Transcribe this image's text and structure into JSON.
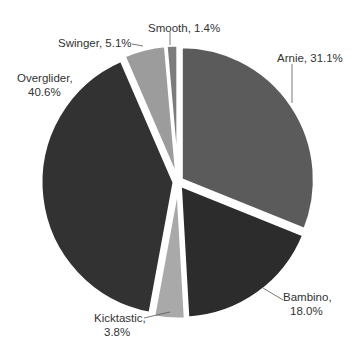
{
  "chart_data": {
    "type": "pie",
    "title": "",
    "start_angle_deg": 0,
    "direction": "clockwise",
    "exploded": true,
    "slices": [
      {
        "label": "Arnie",
        "value": 31.1,
        "display": "Arnie, 31.1%",
        "color": "#5b5b5b"
      },
      {
        "label": "Bambino",
        "value": 18.0,
        "display_line1": "Bambino,",
        "display_line2": "18.0%",
        "color": "#2c2c2c"
      },
      {
        "label": "Kicktastic",
        "value": 3.8,
        "display_line1": "Kicktastic,",
        "display_line2": "3.8%",
        "color": "#a9a9a9"
      },
      {
        "label": "Overglider",
        "value": 40.6,
        "display_line1": "Overglider,",
        "display_line2": "40.6%",
        "color": "#323232"
      },
      {
        "label": "Swinger",
        "value": 5.1,
        "display": "Swinger, 5.1%",
        "color": "#9c9c9c"
      },
      {
        "label": "Smooth",
        "value": 1.4,
        "display": "Smooth, 1.4%",
        "color": "#7c7c7c"
      }
    ]
  }
}
